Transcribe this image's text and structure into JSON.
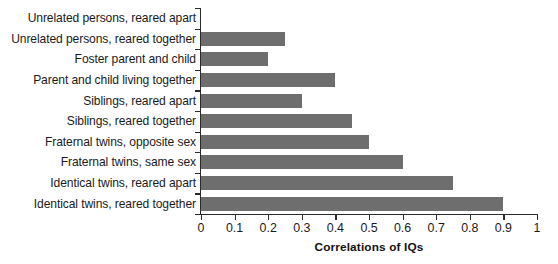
{
  "chart_data": {
    "type": "bar",
    "orientation": "horizontal",
    "title": "",
    "xlabel": "Correlations of IQs",
    "ylabel": "",
    "xlim": [
      0,
      1
    ],
    "grid": false,
    "legend": null,
    "bar_color": "#6e6e6e",
    "axis_color": "#2b2b2b",
    "xticks": [
      "0",
      "0.1",
      "0.2",
      "0.3",
      "0.4",
      "0.5",
      "0.6",
      "0.7",
      "0.8",
      "0.9",
      "1"
    ],
    "xtick_values": [
      0,
      0.1,
      0.2,
      0.3,
      0.4,
      0.5,
      0.6,
      0.7,
      0.8,
      0.9,
      1
    ],
    "categories": [
      "Unrelated persons, reared apart",
      "Unrelated persons, reared together",
      "Foster parent and child",
      "Parent and child living together",
      "Siblings, reared apart",
      "Siblings, reared together",
      "Fraternal twins, opposite sex",
      "Fraternal twins, same sex",
      "Identical twins, reared apart",
      "Identical twins, reared together"
    ],
    "values": [
      0,
      0.25,
      0.2,
      0.4,
      0.3,
      0.45,
      0.5,
      0.6,
      0.75,
      0.9
    ]
  }
}
